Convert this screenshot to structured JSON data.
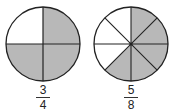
{
  "colors": {
    "shaded": "#b8b8b8",
    "unshaded": "#ffffff",
    "stroke": "#222222"
  },
  "figures": [
    {
      "label_numerator": "3",
      "label_denominator": "4",
      "parts": 4,
      "shaded": 3
    },
    {
      "label_numerator": "5",
      "label_denominator": "8",
      "parts": 8,
      "shaded": 5
    }
  ]
}
